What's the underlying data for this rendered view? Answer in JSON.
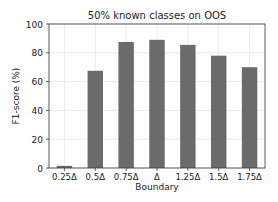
{
  "chart_data": {
    "type": "bar",
    "title": "50% known classes on OOS",
    "xlabel": "Boundary",
    "ylabel": "F1-score (%)",
    "categories": [
      "0.25Δ",
      "0.5Δ",
      "0.75Δ",
      "Δ",
      "1.25Δ",
      "1.5Δ",
      "1.75Δ"
    ],
    "values": [
      1.5,
      67.5,
      87.5,
      89,
      85.5,
      78,
      70
    ],
    "ylim": [
      0,
      100
    ],
    "yticks": [
      0,
      20,
      40,
      60,
      80,
      100
    ],
    "grid": true,
    "legend": null,
    "bar_color": "#6b6b6b"
  }
}
